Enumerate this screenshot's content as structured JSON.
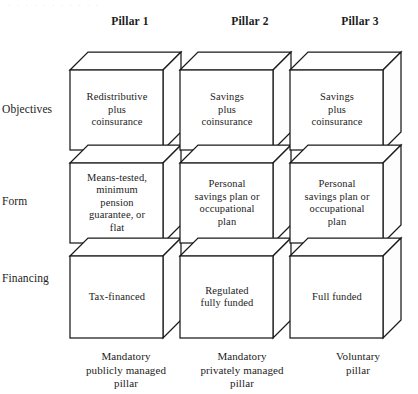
{
  "figure": {
    "scan_artifact_text": "..........."
  },
  "columns": [
    {
      "header": "Pillar 1"
    },
    {
      "header": "Pillar 2"
    },
    {
      "header": "Pillar 3"
    }
  ],
  "rows": [
    {
      "label": "Objectives"
    },
    {
      "label": "Form"
    },
    {
      "label": "Financing"
    }
  ],
  "pillars": [
    {
      "header": "Pillar 1",
      "objectives": "Redistributive\nplus\ncoinsurance",
      "form": "Means-tested,\nminimum\npension\nguarantee, or\nflat",
      "financing": "Tax-financed",
      "caption": "Mandatory\npublicly managed\npillar"
    },
    {
      "header": "Pillar 2",
      "objectives": "Savings\nplus\ncoinsurance",
      "form": "Personal\nsavings plan or\noccupational\nplan",
      "financing": "Regulated\nfully funded",
      "caption": "Mandatory\nprivately managed\npillar"
    },
    {
      "header": "Pillar 3",
      "objectives": "Savings\nplus\ncoinsurance",
      "form": "Personal\nsavings plan or\noccupational\nplan",
      "financing": "Full funded",
      "caption": "Voluntary\npillar"
    }
  ],
  "colors": {
    "stroke": "#1a1a1a",
    "face": "#ffffff",
    "background": "#ffffff",
    "text": "#1c1c1c"
  }
}
